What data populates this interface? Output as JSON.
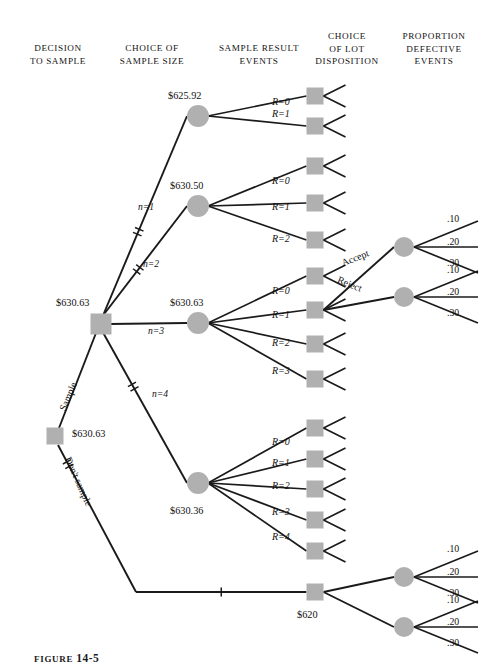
{
  "figure": {
    "caption_prefix": "FIGURE",
    "caption_number": "14-5"
  },
  "columns": [
    {
      "id": "decision-to-sample",
      "label": "DECISION\nTO SAMPLE",
      "x": 14,
      "y": 42
    },
    {
      "id": "choice-of-sample-size",
      "label": "CHOICE OF\nSAMPLE SIZE",
      "x": 112,
      "y": 42
    },
    {
      "id": "sample-result-events",
      "label": "SAMPLE RESULT\nEVENTS",
      "x": 208,
      "y": 42
    },
    {
      "id": "choice-of-lot-disposition",
      "label": "CHOICE\nOF LOT\nDISPOSITION",
      "x": 308,
      "y": 29
    },
    {
      "id": "proportion-defective-events",
      "label": "PROPORTION\nDEFECTIVE\nEVENTS",
      "x": 392,
      "y": 29
    }
  ],
  "nodes": {
    "root_decision": {
      "name": "root-decision-square",
      "type": "decision",
      "x": 55,
      "y": 436,
      "value": "$630.63",
      "value_x": 70,
      "value_y": 430
    },
    "sample_decision": {
      "name": "sample-size-decision-square",
      "type": "decision",
      "x": 101,
      "y": 324,
      "value": "$630.63",
      "value_x": 62,
      "value_y": 300
    },
    "n1_chance": {
      "name": "chance-node-n1",
      "type": "chance",
      "x": 198,
      "y": 116,
      "value": "$625.92",
      "value_x": 168,
      "value_y": 92
    },
    "n2_chance": {
      "name": "chance-node-n2",
      "type": "chance",
      "x": 198,
      "y": 206,
      "value": "$630.50",
      "value_x": 170,
      "value_y": 182
    },
    "n3_chance": {
      "name": "chance-node-n3",
      "type": "chance",
      "x": 198,
      "y": 323,
      "value": "$630.63",
      "value_x": 170,
      "value_y": 299
    },
    "n4_chance": {
      "name": "chance-node-n4",
      "type": "chance",
      "x": 198,
      "y": 483,
      "value": "$630.36",
      "value_x": 170,
      "value_y": 508
    },
    "no_sample_decision": {
      "name": "no-sample-decision-square",
      "type": "decision",
      "x": 315,
      "y": 592,
      "value": "$620",
      "value_x": 300,
      "value_y": 612
    }
  },
  "sample_size_branches": [
    {
      "label": "n=1",
      "label_x": 142,
      "label_y": 208,
      "pruned": true
    },
    {
      "label": "n=2",
      "label_x": 146,
      "label_y": 264,
      "pruned": true
    },
    {
      "label": "n=3",
      "label_x": 148,
      "label_y": 330,
      "pruned": false
    },
    {
      "label": "n=4",
      "label_x": 152,
      "label_y": 394,
      "pruned": true
    }
  ],
  "root_branches": [
    {
      "label": "Sample",
      "label_x": 63,
      "label_y": 382,
      "angle": -68,
      "pruned": false
    },
    {
      "label": "Don't sample",
      "label_x": 72,
      "label_y": 460,
      "angle": 60,
      "pruned": true
    }
  ],
  "groups": [
    {
      "id": "n1-group",
      "n": 1,
      "results": [
        {
          "label": "R=0",
          "label_x": 272,
          "label_y": 103,
          "square_y": 96
        },
        {
          "label": "R=1",
          "label_x": 272,
          "label_y": 115,
          "square_y": 126
        }
      ]
    },
    {
      "id": "n2-group",
      "n": 2,
      "results": [
        {
          "label": "R=0",
          "label_x": 272,
          "label_y": 182,
          "square_y": 166
        },
        {
          "label": "R=1",
          "label_x": 272,
          "label_y": 208,
          "square_y": 203
        },
        {
          "label": "R=2",
          "label_x": 272,
          "label_y": 240,
          "square_y": 240
        }
      ]
    },
    {
      "id": "n3-group",
      "n": 3,
      "results": [
        {
          "label": "R=0",
          "label_x": 272,
          "label_y": 292,
          "square_y": 276
        },
        {
          "label": "R=1",
          "label_x": 272,
          "label_y": 316,
          "square_y": 310
        },
        {
          "label": "R=2",
          "label_x": 272,
          "label_y": 344,
          "square_y": 344
        },
        {
          "label": "R=3",
          "label_x": 272,
          "label_y": 372,
          "square_y": 379
        }
      ]
    },
    {
      "id": "n4-group",
      "n": 4,
      "results": [
        {
          "label": "R=0",
          "label_x": 272,
          "label_y": 443,
          "square_y": 428
        },
        {
          "label": "R=1",
          "label_x": 272,
          "label_y": 464,
          "square_y": 459
        },
        {
          "label": "R=2",
          "label_x": 272,
          "label_y": 487,
          "square_y": 489
        },
        {
          "label": "R=3",
          "label_x": 272,
          "label_y": 513,
          "square_y": 520
        },
        {
          "label": "R=4",
          "label_x": 272,
          "label_y": 538,
          "square_y": 551
        }
      ]
    }
  ],
  "disposition": {
    "accept_label": "Accept",
    "reject_label": "Reject",
    "top": {
      "accept_x": 343,
      "accept_y": 259,
      "accept_angle": -22,
      "reject_x": 343,
      "reject_y": 281,
      "reject_angle": 22,
      "accept_node_x": 404,
      "accept_node_y": 247,
      "reject_node_x": 404,
      "reject_node_y": 297
    },
    "bottom": {
      "accept_x": 343,
      "accept_y": 589,
      "accept_angle": -22,
      "reject_x": 343,
      "reject_y": 611,
      "reject_angle": 22,
      "accept_node_x": 404,
      "accept_node_y": 577,
      "reject_node_x": 404,
      "reject_node_y": 627
    }
  },
  "proportion_defective": {
    "probabilities": [
      ".10",
      ".20",
      ".30"
    ],
    "top_accept": [
      {
        "p": ".10",
        "x": 447,
        "y": 219
      },
      {
        "p": ".20",
        "x": 447,
        "y": 242
      },
      {
        "p": ".30",
        "x": 447,
        "y": 263
      }
    ],
    "top_reject": [
      {
        "p": ".10",
        "x": 447,
        "y": 270
      },
      {
        "p": ".20",
        "x": 447,
        "y": 292
      },
      {
        "p": ".30",
        "x": 447,
        "y": 313
      }
    ],
    "bottom_accept": [
      {
        "p": ".10",
        "x": 447,
        "y": 549
      },
      {
        "p": ".20",
        "x": 447,
        "y": 572
      },
      {
        "p": ".30",
        "x": 447,
        "y": 593
      }
    ],
    "bottom_reject": [
      {
        "p": ".10",
        "x": 447,
        "y": 600
      },
      {
        "p": ".20",
        "x": 447,
        "y": 622
      },
      {
        "p": ".30",
        "x": 447,
        "y": 643
      }
    ]
  },
  "style": {
    "node_fill": "#b0b0b0",
    "line_color": "#1a1a1a",
    "decision_size": 17,
    "chance_radius": 10,
    "small_square": 17
  }
}
